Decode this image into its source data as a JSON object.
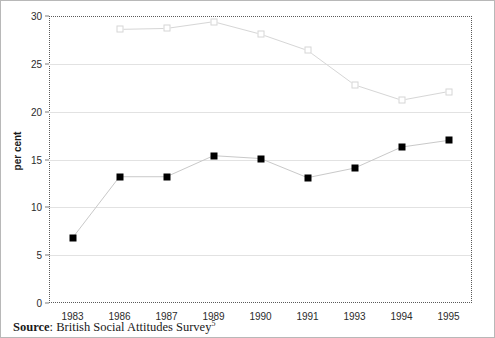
{
  "caption": {
    "source_label": "Source",
    "separator": ": ",
    "source_text": "British Social Attitudes Survey",
    "footnote_marker": "5"
  },
  "colors": {
    "series_primary": "#000000",
    "series_secondary": "#d6d6d6",
    "gridline": "#e2e2e2",
    "frame": "#5a5a5a",
    "text": "#1a1a1a",
    "background": "#ffffff"
  },
  "chart_data": {
    "type": "line",
    "title": "",
    "subtitle": "",
    "xlabel": "",
    "ylabel": "per cent",
    "categories": [
      "1983",
      "1986",
      "1987",
      "1989",
      "1990",
      "1991",
      "1993",
      "1994",
      "1995"
    ],
    "xtick_labels": [
      "1983",
      "1986",
      "1987",
      "1989",
      "1990",
      "1991",
      "1993",
      "1994",
      "1995"
    ],
    "ytick_labels": [
      "0",
      "5",
      "10",
      "15",
      "20",
      "25",
      "30"
    ],
    "yticks": [
      0,
      5,
      10,
      15,
      20,
      25,
      30
    ],
    "ylim": [
      0,
      30
    ],
    "grid": "horizontal",
    "legend": "none",
    "legend_position": "none",
    "series": [
      {
        "name": "series-filled-square",
        "marker": "filled-square",
        "color": "#000000",
        "values": [
          6.8,
          13.2,
          13.2,
          15.4,
          15.1,
          13.1,
          14.1,
          16.3,
          17.0
        ]
      },
      {
        "name": "series-open-square",
        "marker": "open-square",
        "color": "#d6d6d6",
        "values": [
          null,
          28.6,
          28.7,
          29.4,
          28.1,
          26.4,
          22.8,
          21.2,
          22.1
        ]
      }
    ],
    "annotations": []
  }
}
